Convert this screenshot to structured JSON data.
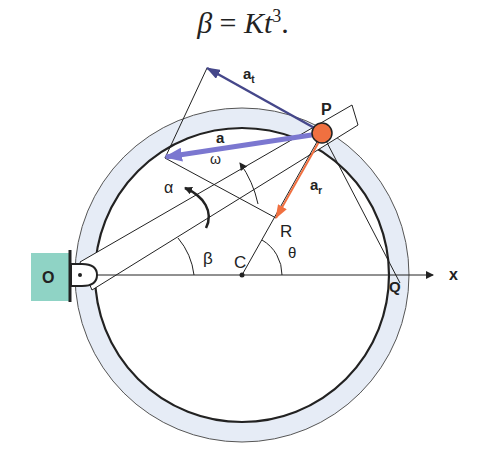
{
  "equation": {
    "lhs": "β",
    "eq": " = ",
    "K": "K",
    "t": "t",
    "exp": "3",
    "end": "."
  },
  "labels": {
    "O": "O",
    "P": "P",
    "Q": "Q",
    "C": "C",
    "R": "R",
    "x": "x",
    "a": "a",
    "at_base": "a",
    "at_sub": "t",
    "ar_base": "a",
    "ar_sub": "r",
    "omega": "ω",
    "alpha": "α",
    "beta": "β",
    "theta": "θ"
  },
  "colors": {
    "ring_fill": "#e6ecf6",
    "support": "#8fd3c5",
    "particle": "#f07040",
    "vec_a": "#7b77d0",
    "vec_at": "#45478a",
    "vec_ar": "#f07040",
    "line": "#222222"
  }
}
